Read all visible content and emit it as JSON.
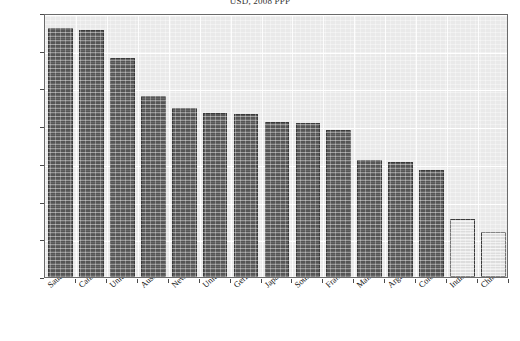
{
  "chart_data": {
    "type": "bar",
    "title": "USD, 2008 PPP",
    "xlabel": "",
    "ylabel": "",
    "ylim": [
      0,
      7000
    ],
    "ytick_step": 1000,
    "ytick_labels": [
      "7 000",
      "6 000",
      "5 000",
      "4 000",
      "3 000",
      "2 000",
      "1 000",
      "0"
    ],
    "ytick_values": [
      7000,
      6000,
      5000,
      4000,
      3000,
      2000,
      1000,
      0
    ],
    "grid": true,
    "legend": "none",
    "categories": [
      "Saudi Arabia",
      "Canada",
      "United States",
      "Australia",
      "New Zealand",
      "United Kingdom",
      "Germany",
      "Japan",
      "South Africa",
      "France",
      "Malaysia",
      "Argentina",
      "Colombia",
      "India",
      "China"
    ],
    "values": [
      6611,
      6548,
      5816,
      4795,
      4490,
      4343,
      4333,
      4112,
      4076,
      3905,
      3107,
      3054,
      2826,
      1547,
      1182
    ],
    "value_labels": [
      "6 611",
      "6 548",
      "5 816",
      "4 795",
      "4 490",
      "4 343",
      "4 333",
      "4 112",
      "4 076",
      "3 905",
      "3 107",
      "3 054",
      "2 826",
      "1 547",
      "1 182"
    ],
    "bar_styles": [
      "dark",
      "dark",
      "dark",
      "dark",
      "dark",
      "dark",
      "dark",
      "dark",
      "dark",
      "dark",
      "dark",
      "dark",
      "dark",
      "light",
      "light"
    ],
    "colors": {
      "bar_dark": "#5a5a5a",
      "bar_light": "#e4e4e4",
      "bar_border": "#3b3b3b",
      "plot_background": "#e9e9e9",
      "gridline": "#ffffff",
      "frame_border": "#6a6a6a",
      "page_background": "#ffffff",
      "text": "#111111"
    }
  }
}
